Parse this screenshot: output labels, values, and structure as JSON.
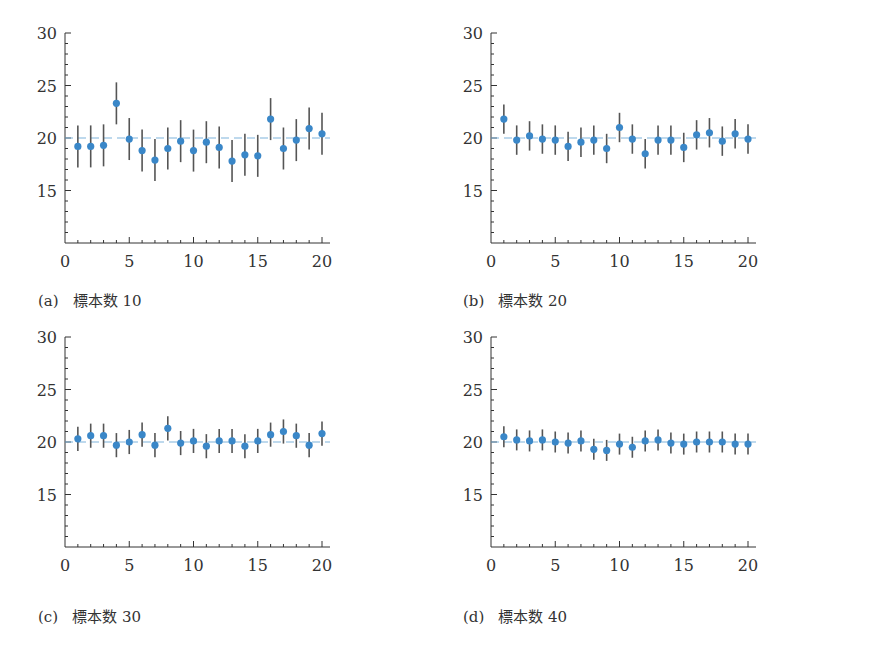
{
  "style": {
    "point_color": "#3a87c8",
    "errorbar_color": "#555555",
    "refline_color": "#7fb3dc",
    "axis_color": "#333333"
  },
  "chart_data": [
    {
      "type": "scatter",
      "subtype": "errorbar",
      "id": "a",
      "caption_tag": "(a)",
      "caption_text": "標本数 10",
      "title": "",
      "xlabel": "",
      "ylabel": "",
      "xlim": [
        0,
        20
      ],
      "ylim": [
        10,
        30
      ],
      "xticks": [
        0,
        5,
        10,
        15,
        20
      ],
      "yticks": [
        15,
        20,
        25,
        30
      ],
      "reference_line": 20,
      "grid": false,
      "x": [
        1,
        2,
        3,
        4,
        5,
        6,
        7,
        8,
        9,
        10,
        11,
        12,
        13,
        14,
        15,
        16,
        17,
        18,
        19,
        20
      ],
      "values": [
        19.2,
        19.2,
        19.3,
        23.3,
        19.9,
        18.8,
        17.9,
        19.0,
        19.7,
        18.8,
        19.6,
        19.1,
        17.8,
        18.4,
        18.3,
        21.8,
        19.0,
        19.8,
        20.9,
        20.4
      ],
      "error": 2.0
    },
    {
      "type": "scatter",
      "subtype": "errorbar",
      "id": "b",
      "caption_tag": "(b)",
      "caption_text": "標本数 20",
      "title": "",
      "xlabel": "",
      "ylabel": "",
      "xlim": [
        0,
        20
      ],
      "ylim": [
        10,
        30
      ],
      "xticks": [
        0,
        5,
        10,
        15,
        20
      ],
      "yticks": [
        15,
        20,
        25,
        30
      ],
      "reference_line": 20,
      "grid": false,
      "x": [
        1,
        2,
        3,
        4,
        5,
        6,
        7,
        8,
        9,
        10,
        11,
        12,
        13,
        14,
        15,
        16,
        17,
        18,
        19,
        20
      ],
      "values": [
        21.8,
        19.8,
        20.2,
        19.9,
        19.8,
        19.2,
        19.6,
        19.8,
        19.0,
        21.0,
        19.9,
        18.5,
        19.8,
        19.8,
        19.1,
        20.3,
        20.5,
        19.7,
        20.4,
        19.9
      ],
      "error": 1.4
    },
    {
      "type": "scatter",
      "subtype": "errorbar",
      "id": "c",
      "caption_tag": "(c)",
      "caption_text": "標本数 30",
      "title": "",
      "xlabel": "",
      "ylabel": "",
      "xlim": [
        0,
        20
      ],
      "ylim": [
        10,
        30
      ],
      "xticks": [
        0,
        5,
        10,
        15,
        20
      ],
      "yticks": [
        15,
        20,
        25,
        30
      ],
      "reference_line": 20,
      "grid": false,
      "x": [
        1,
        2,
        3,
        4,
        5,
        6,
        7,
        8,
        9,
        10,
        11,
        12,
        13,
        14,
        15,
        16,
        17,
        18,
        19,
        20
      ],
      "values": [
        20.3,
        20.6,
        20.6,
        19.7,
        20.0,
        20.7,
        19.7,
        21.3,
        19.9,
        20.1,
        19.6,
        20.1,
        20.1,
        19.6,
        20.1,
        20.7,
        21.0,
        20.6,
        19.7,
        20.8
      ],
      "error": 1.15
    },
    {
      "type": "scatter",
      "subtype": "errorbar",
      "id": "d",
      "caption_tag": "(d)",
      "caption_text": "標本数 40",
      "title": "",
      "xlabel": "",
      "ylabel": "",
      "xlim": [
        0,
        20
      ],
      "ylim": [
        10,
        30
      ],
      "xticks": [
        0,
        5,
        10,
        15,
        20
      ],
      "yticks": [
        15,
        20,
        25,
        30
      ],
      "reference_line": 20,
      "grid": false,
      "x": [
        1,
        2,
        3,
        4,
        5,
        6,
        7,
        8,
        9,
        10,
        11,
        12,
        13,
        14,
        15,
        16,
        17,
        18,
        19,
        20
      ],
      "values": [
        20.5,
        20.2,
        20.1,
        20.2,
        20.0,
        19.9,
        20.1,
        19.3,
        19.2,
        19.8,
        19.5,
        20.1,
        20.2,
        19.9,
        19.8,
        20.0,
        20.0,
        20.0,
        19.8,
        19.8
      ],
      "error": 1.0
    }
  ]
}
